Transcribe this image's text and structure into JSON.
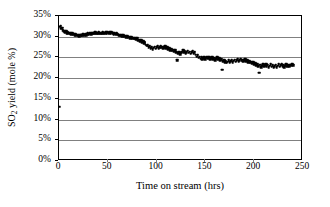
{
  "chart_data": {
    "type": "scatter",
    "title": "",
    "subtitle": "",
    "xlabel": "Time on stream (hrs)",
    "ylabel": "SO2 yield (mole %)",
    "ylabel_parts": {
      "pre": "SO",
      "sub": "2",
      "post": " yield (mole %)"
    },
    "xlim": [
      0,
      250
    ],
    "ylim": [
      0,
      35
    ],
    "xticks": [
      0,
      50,
      100,
      150,
      200,
      250
    ],
    "xtick_labels": [
      "0",
      "50",
      "100",
      "150",
      "200",
      "250"
    ],
    "yticks": [
      0,
      5,
      10,
      15,
      20,
      25,
      30,
      35
    ],
    "ytick_labels": [
      "0%",
      "5%",
      "10%",
      "15%",
      "20%",
      "25%",
      "30%",
      "35%"
    ],
    "grid": {
      "horizontal": true,
      "vertical": false,
      "color": "#808080"
    },
    "legend": {
      "visible": false,
      "position": "none"
    },
    "marker": {
      "shape": "square",
      "color": "#000000",
      "size": 2.6
    },
    "series": [
      {
        "name": "SO2 yield",
        "points": [
          [
            0.4,
            13.1
          ],
          [
            0.8,
            32.4
          ],
          [
            1.6,
            32.6
          ],
          [
            2.4,
            31.9
          ],
          [
            3.2,
            32.2
          ],
          [
            4.0,
            31.6
          ],
          [
            4.8,
            31.3
          ],
          [
            5.6,
            31.5
          ],
          [
            6.4,
            31.1
          ],
          [
            7.2,
            31.4
          ],
          [
            8.0,
            30.9
          ],
          [
            8.8,
            31.2
          ],
          [
            9.6,
            30.8
          ],
          [
            10.4,
            31.0
          ],
          [
            11.2,
            30.7
          ],
          [
            12.0,
            30.9
          ],
          [
            12.8,
            30.6
          ],
          [
            13.6,
            30.8
          ],
          [
            14.4,
            30.5
          ],
          [
            15.2,
            30.7
          ],
          [
            16.0,
            30.4
          ],
          [
            16.8,
            30.6
          ],
          [
            17.6,
            30.3
          ],
          [
            18.4,
            30.5
          ],
          [
            19.2,
            30.2
          ],
          [
            20.0,
            30.4
          ],
          [
            20.8,
            30.1
          ],
          [
            21.6,
            30.3
          ],
          [
            22.4,
            30.5
          ],
          [
            23.2,
            30.2
          ],
          [
            24.0,
            30.4
          ],
          [
            24.8,
            30.6
          ],
          [
            25.6,
            30.3
          ],
          [
            26.4,
            30.5
          ],
          [
            27.2,
            30.7
          ],
          [
            28.0,
            30.4
          ],
          [
            28.8,
            30.6
          ],
          [
            29.6,
            30.8
          ],
          [
            30.4,
            30.5
          ],
          [
            31.2,
            30.7
          ],
          [
            32.0,
            30.9
          ],
          [
            32.8,
            30.6
          ],
          [
            33.6,
            30.8
          ],
          [
            34.4,
            31.0
          ],
          [
            35.2,
            30.7
          ],
          [
            36.0,
            30.9
          ],
          [
            36.8,
            31.1
          ],
          [
            37.6,
            30.8
          ],
          [
            38.4,
            31.0
          ],
          [
            39.2,
            30.7
          ],
          [
            40.0,
            30.9
          ],
          [
            40.8,
            31.1
          ],
          [
            41.6,
            30.8
          ],
          [
            42.4,
            31.0
          ],
          [
            43.2,
            30.7
          ],
          [
            44.0,
            30.9
          ],
          [
            44.8,
            31.1
          ],
          [
            45.6,
            30.8
          ],
          [
            46.4,
            31.0
          ],
          [
            47.2,
            30.8
          ],
          [
            48.0,
            31.1
          ],
          [
            48.8,
            30.9
          ],
          [
            49.6,
            31.2
          ],
          [
            50.4,
            31.0
          ],
          [
            51.2,
            30.8
          ],
          [
            52.0,
            31.1
          ],
          [
            52.8,
            30.9
          ],
          [
            53.6,
            31.2
          ],
          [
            54.4,
            31.0
          ],
          [
            55.2,
            30.8
          ],
          [
            56.0,
            30.6
          ],
          [
            56.8,
            30.9
          ],
          [
            57.6,
            30.7
          ],
          [
            58.4,
            30.5
          ],
          [
            59.2,
            30.8
          ],
          [
            60.0,
            30.6
          ],
          [
            61.0,
            30.3
          ],
          [
            62.0,
            30.5
          ],
          [
            63.0,
            30.2
          ],
          [
            64.0,
            30.4
          ],
          [
            65.0,
            30.1
          ],
          [
            66.0,
            30.3
          ],
          [
            67.0,
            30.0
          ],
          [
            68.0,
            30.2
          ],
          [
            69.0,
            29.9
          ],
          [
            70.0,
            30.1
          ],
          [
            71.0,
            29.8
          ],
          [
            72.0,
            30.0
          ],
          [
            73.0,
            29.7
          ],
          [
            74.0,
            29.9
          ],
          [
            75.0,
            29.6
          ],
          [
            76.0,
            29.8
          ],
          [
            77.0,
            29.5
          ],
          [
            78.0,
            29.7
          ],
          [
            79.0,
            29.4
          ],
          [
            80.0,
            29.6
          ],
          [
            81.0,
            29.0
          ],
          [
            82.0,
            29.3
          ],
          [
            83.0,
            28.8
          ],
          [
            84.0,
            29.1
          ],
          [
            85.0,
            28.6
          ],
          [
            86.0,
            28.9
          ],
          [
            87.0,
            28.4
          ],
          [
            88.0,
            28.7
          ],
          [
            89.0,
            28.1
          ],
          [
            90.0,
            27.8
          ],
          [
            91.0,
            28.0
          ],
          [
            92.0,
            27.5
          ],
          [
            93.0,
            27.7
          ],
          [
            94.0,
            27.2
          ],
          [
            95.0,
            27.5
          ],
          [
            96.0,
            27.0
          ],
          [
            97.0,
            27.3
          ],
          [
            98.0,
            27.6
          ],
          [
            99.0,
            27.1
          ],
          [
            100.0,
            27.4
          ],
          [
            101.0,
            27.7
          ],
          [
            102.0,
            27.2
          ],
          [
            103.0,
            27.5
          ],
          [
            104.0,
            27.8
          ],
          [
            105.0,
            27.3
          ],
          [
            106.0,
            27.6
          ],
          [
            107.0,
            27.1
          ],
          [
            108.0,
            27.4
          ],
          [
            109.0,
            27.7
          ],
          [
            110.0,
            27.2
          ],
          [
            111.0,
            27.5
          ],
          [
            112.0,
            27.0
          ],
          [
            113.0,
            27.3
          ],
          [
            114.0,
            26.8
          ],
          [
            115.0,
            27.1
          ],
          [
            116.0,
            26.6
          ],
          [
            117.0,
            26.9
          ],
          [
            118.0,
            26.4
          ],
          [
            119.0,
            26.7
          ],
          [
            120.0,
            26.2
          ],
          [
            121.0,
            24.4
          ],
          [
            122.0,
            26.0
          ],
          [
            123.0,
            26.3
          ],
          [
            124.0,
            25.8
          ],
          [
            125.0,
            26.1
          ],
          [
            126.0,
            26.4
          ],
          [
            127.0,
            26.7
          ],
          [
            128.0,
            26.2
          ],
          [
            129.0,
            26.5
          ],
          [
            130.0,
            26.0
          ],
          [
            131.0,
            26.3
          ],
          [
            132.0,
            26.6
          ],
          [
            133.0,
            26.1
          ],
          [
            134.0,
            26.4
          ],
          [
            135.0,
            25.9
          ],
          [
            136.0,
            26.2
          ],
          [
            137.0,
            26.5
          ],
          [
            138.0,
            26.0
          ],
          [
            139.0,
            26.3
          ],
          [
            140.0,
            25.7
          ],
          [
            141.0,
            25.2
          ],
          [
            142.0,
            25.5
          ],
          [
            143.0,
            24.9
          ],
          [
            144.0,
            25.2
          ],
          [
            145.0,
            24.7
          ],
          [
            146.0,
            25.0
          ],
          [
            147.0,
            24.5
          ],
          [
            148.0,
            24.8
          ],
          [
            149.0,
            25.1
          ],
          [
            150.0,
            24.6
          ],
          [
            151.0,
            24.9
          ],
          [
            152.0,
            25.2
          ],
          [
            153.0,
            24.7
          ],
          [
            154.0,
            25.0
          ],
          [
            155.0,
            24.5
          ],
          [
            156.0,
            24.8
          ],
          [
            157.0,
            25.1
          ],
          [
            158.0,
            24.6
          ],
          [
            159.0,
            24.9
          ],
          [
            160.0,
            24.4
          ],
          [
            161.0,
            24.7
          ],
          [
            162.0,
            25.0
          ],
          [
            163.0,
            24.5
          ],
          [
            164.0,
            24.8
          ],
          [
            165.0,
            24.3
          ],
          [
            166.0,
            24.6
          ],
          [
            167.0,
            22.0
          ],
          [
            168.0,
            24.1
          ],
          [
            169.0,
            24.4
          ],
          [
            170.0,
            23.9
          ],
          [
            171.0,
            24.2
          ],
          [
            172.0,
            23.7
          ],
          [
            173.0,
            24.0
          ],
          [
            174.0,
            24.3
          ],
          [
            175.0,
            23.8
          ],
          [
            176.0,
            24.1
          ],
          [
            177.0,
            24.4
          ],
          [
            178.0,
            23.9
          ],
          [
            179.0,
            24.2
          ],
          [
            180.0,
            24.5
          ],
          [
            181.0,
            24.0
          ],
          [
            182.0,
            24.3
          ],
          [
            183.0,
            24.6
          ],
          [
            184.0,
            24.1
          ],
          [
            185.0,
            24.4
          ],
          [
            186.0,
            24.7
          ],
          [
            187.0,
            24.2
          ],
          [
            188.0,
            24.5
          ],
          [
            189.0,
            24.0
          ],
          [
            190.0,
            24.3
          ],
          [
            191.0,
            24.6
          ],
          [
            192.0,
            24.1
          ],
          [
            193.0,
            24.4
          ],
          [
            194.0,
            23.9
          ],
          [
            195.0,
            24.2
          ],
          [
            196.0,
            23.7
          ],
          [
            197.0,
            24.0
          ],
          [
            198.0,
            23.5
          ],
          [
            199.0,
            23.8
          ],
          [
            200.0,
            23.3
          ],
          [
            201.0,
            23.6
          ],
          [
            202.0,
            23.1
          ],
          [
            203.0,
            23.4
          ],
          [
            204.0,
            22.9
          ],
          [
            205.0,
            21.3
          ],
          [
            206.0,
            23.2
          ],
          [
            207.0,
            22.7
          ],
          [
            208.0,
            23.0
          ],
          [
            209.0,
            23.3
          ],
          [
            210.0,
            22.8
          ],
          [
            211.0,
            23.1
          ],
          [
            212.0,
            23.4
          ],
          [
            213.0,
            22.9
          ],
          [
            214.0,
            23.2
          ],
          [
            215.0,
            22.7
          ],
          [
            216.0,
            23.0
          ],
          [
            217.0,
            23.3
          ],
          [
            218.0,
            22.8
          ],
          [
            219.0,
            23.1
          ],
          [
            220.0,
            22.6
          ],
          [
            221.0,
            22.9
          ],
          [
            222.0,
            23.2
          ],
          [
            223.0,
            22.7
          ],
          [
            224.0,
            23.0
          ],
          [
            225.0,
            23.3
          ],
          [
            226.0,
            22.8
          ],
          [
            227.0,
            23.1
          ],
          [
            228.0,
            23.4
          ],
          [
            229.0,
            22.9
          ],
          [
            230.0,
            23.2
          ],
          [
            231.0,
            22.7
          ],
          [
            232.0,
            23.0
          ],
          [
            233.0,
            23.3
          ],
          [
            234.0,
            22.8
          ],
          [
            235.0,
            23.1
          ],
          [
            236.0,
            22.9
          ],
          [
            237.0,
            23.2
          ],
          [
            238.0,
            23.0
          ],
          [
            239.0,
            23.3
          ],
          [
            240.0,
            23.1
          ]
        ]
      }
    ]
  }
}
